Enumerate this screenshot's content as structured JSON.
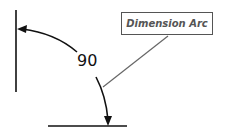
{
  "diagram": {
    "callout_label": "Dimension Arc",
    "angle_value": "90",
    "colors": {
      "lines": "#111111",
      "leader": "#666666",
      "callout_border": "#555555",
      "callout_text": "#555555"
    }
  }
}
